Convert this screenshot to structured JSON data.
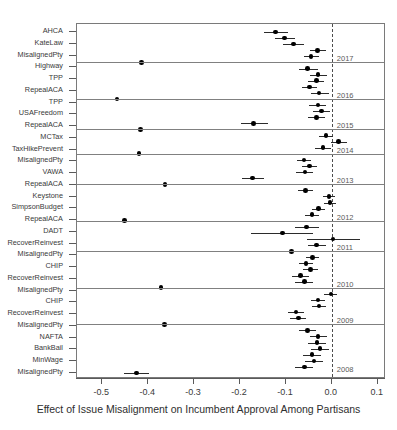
{
  "chart_data": {
    "type": "scatter",
    "title": "",
    "xlabel": "Effect of Issue Misalignment on Incumbent Approval Among Partisans",
    "ylabel": "",
    "xlim": [
      -0.555,
      0.118
    ],
    "xticks": [
      -0.5,
      -0.4,
      -0.3,
      -0.2,
      -0.1,
      0.0,
      0.1
    ],
    "xticklabels": [
      "-0.5",
      "-0.4",
      "-0.3",
      "-0.2",
      "-0.1",
      "0.0",
      "0.1"
    ],
    "grid": false,
    "legend_position": "none",
    "reference_line": 0.0,
    "reference_line_style": "dashed",
    "year_labels": [
      "2017",
      "2016",
      "2015",
      "2014",
      "2013",
      "2012",
      "2011",
      "2010",
      "2009",
      "2008"
    ],
    "categories": [
      "AHCA",
      "KateLaw",
      "MisalignedPty",
      "Highway",
      "TPP",
      "RepealACA",
      "TPP",
      "USAFreedom",
      "RepealACA",
      "MCTax",
      "TaxHikePrevent",
      "MisalignedPty",
      "VAWA",
      "RepealACA",
      "Keystone",
      "SimpsonBudget",
      "RepealACA",
      "DADT",
      "RecoverReinvest",
      "MisalignedPty",
      "CHIP",
      "RecoverReinvest",
      "MisalignedPty",
      "CHIP",
      "RecoverReinvest",
      "MisalignedPty",
      "NAFTA",
      "BankBail",
      "MinWage",
      "MisalignedPty"
    ],
    "points": [
      {
        "label": "AHCA",
        "estimate": -0.123,
        "low": -0.147,
        "high": -0.095,
        "year": "2017"
      },
      {
        "label": "KateLaw",
        "estimate": -0.103,
        "low": -0.124,
        "high": -0.08,
        "year": "2017"
      },
      {
        "label": "MisalignedPty",
        "estimate": -0.084,
        "low": -0.107,
        "high": -0.06,
        "year": "2017"
      },
      {
        "label": "Highway",
        "estimate": -0.031,
        "low": -0.048,
        "high": -0.012,
        "year": "2017"
      },
      {
        "label": "TPP",
        "estimate": -0.045,
        "low": -0.06,
        "high": -0.028,
        "year": "2017"
      },
      {
        "label": "RepealACA",
        "estimate": -0.415,
        "low": -0.438,
        "high": -0.39,
        "year": "2017"
      },
      {
        "label": "TPP",
        "estimate": -0.053,
        "low": -0.072,
        "high": -0.03,
        "year": "2016"
      },
      {
        "label": "USAFreedom",
        "estimate": -0.03,
        "low": -0.048,
        "high": -0.01,
        "year": "2016"
      },
      {
        "label": "RepealACA",
        "estimate": -0.034,
        "low": -0.052,
        "high": -0.016,
        "year": "2016"
      },
      {
        "label": "MCTax",
        "estimate": -0.049,
        "low": -0.065,
        "high": -0.032,
        "year": "2016"
      },
      {
        "label": "TaxHikePrevent",
        "estimate": -0.028,
        "low": -0.046,
        "high": -0.007,
        "year": "2016"
      },
      {
        "label": "MisalignedPty",
        "estimate": -0.468,
        "low": -0.5,
        "high": -0.434,
        "year": "2016"
      },
      {
        "label": "VAWA",
        "estimate": -0.03,
        "low": -0.05,
        "high": -0.012,
        "year": "2015"
      },
      {
        "label": "RepealACA",
        "estimate": -0.022,
        "low": -0.04,
        "high": -0.003,
        "year": "2015"
      },
      {
        "label": "Keystone",
        "estimate": -0.034,
        "low": -0.052,
        "high": -0.014,
        "year": "2015"
      },
      {
        "label": "SimpsonBudget",
        "estimate": -0.17,
        "low": -0.198,
        "high": -0.14,
        "year": "2015"
      },
      {
        "label": "RepealACA",
        "estimate": -0.417,
        "low": -0.442,
        "high": -0.39,
        "year": "2015"
      },
      {
        "label": "DADT",
        "estimate": -0.013,
        "low": -0.028,
        "high": 0.002,
        "year": "2014"
      },
      {
        "label": "RecoverReinvest",
        "estimate": 0.015,
        "low": -0.002,
        "high": 0.032,
        "year": "2014"
      },
      {
        "label": "MisalignedPty",
        "estimate": -0.019,
        "low": -0.036,
        "high": -0.002,
        "year": "2014"
      },
      {
        "label": "CHIP",
        "estimate": -0.42,
        "low": -0.445,
        "high": -0.392,
        "year": "2014"
      },
      {
        "label": "RecoverReinvest",
        "estimate": -0.061,
        "low": -0.076,
        "high": -0.045,
        "year": "2013"
      },
      {
        "label": "MisalignedPty",
        "estimate": -0.049,
        "low": -0.065,
        "high": -0.032,
        "year": "2013"
      },
      {
        "label": "CHIP",
        "estimate": -0.058,
        "low": -0.077,
        "high": -0.04,
        "year": "2013"
      },
      {
        "label": "RecoverReinvest",
        "estimate": -0.173,
        "low": -0.195,
        "high": -0.148,
        "year": "2013"
      },
      {
        "label": "MisalignedPty",
        "estimate": -0.363,
        "low": -0.382,
        "high": -0.343,
        "year": "2013"
      },
      {
        "label": "NAFTA",
        "estimate": -0.057,
        "low": -0.074,
        "high": -0.04,
        "year": "2012"
      },
      {
        "label": "BankBail",
        "estimate": -0.006,
        "low": -0.02,
        "high": 0.008,
        "year": "2012"
      },
      {
        "label": "MinWage",
        "estimate": -0.004,
        "low": -0.018,
        "high": 0.01,
        "year": "2012"
      },
      {
        "label": "MisalignedPty",
        "estimate": -0.029,
        "low": -0.043,
        "high": -0.014,
        "year": "2012"
      },
      {
        "label": "pt31",
        "estimate": -0.043,
        "low": -0.058,
        "high": -0.029,
        "year": "2012"
      },
      {
        "label": "pt32",
        "estimate": -0.452,
        "low": -0.47,
        "high": -0.432,
        "year": "2012"
      },
      {
        "label": "pt33",
        "estimate": -0.055,
        "low": -0.08,
        "high": -0.028,
        "year": "2011"
      },
      {
        "label": "pt34",
        "estimate": -0.108,
        "low": -0.175,
        "high": -0.04,
        "year": "2011"
      },
      {
        "label": "pt35",
        "estimate": 0.003,
        "low": -0.055,
        "high": 0.062,
        "year": "2011"
      },
      {
        "label": "pt36",
        "estimate": -0.034,
        "low": -0.052,
        "high": -0.012,
        "year": "2011"
      },
      {
        "label": "pt37",
        "estimate": -0.088,
        "low": -0.13,
        "high": -0.048,
        "year": "2011"
      },
      {
        "label": "pt38",
        "estimate": -0.042,
        "low": -0.056,
        "high": -0.028,
        "year": "2010"
      },
      {
        "label": "pt39",
        "estimate": -0.056,
        "low": -0.072,
        "high": -0.04,
        "year": "2010"
      },
      {
        "label": "pt40",
        "estimate": -0.046,
        "low": -0.062,
        "high": -0.03,
        "year": "2010"
      },
      {
        "label": "pt41",
        "estimate": -0.068,
        "low": -0.086,
        "high": -0.05,
        "year": "2010"
      },
      {
        "label": "pt42",
        "estimate": -0.06,
        "low": -0.08,
        "high": -0.042,
        "year": "2010"
      },
      {
        "label": "pt43",
        "estimate": -0.372,
        "low": -0.39,
        "high": -0.352,
        "year": "2010"
      },
      {
        "label": "pt44",
        "estimate": -0.002,
        "low": -0.016,
        "high": 0.012,
        "year": "2009"
      },
      {
        "label": "pt45",
        "estimate": -0.03,
        "low": -0.046,
        "high": -0.014,
        "year": "2009"
      },
      {
        "label": "pt46",
        "estimate": -0.028,
        "low": -0.044,
        "high": -0.012,
        "year": "2009"
      },
      {
        "label": "pt47",
        "estimate": -0.078,
        "low": -0.096,
        "high": -0.06,
        "year": "2009"
      },
      {
        "label": "pt48",
        "estimate": -0.073,
        "low": -0.09,
        "high": -0.056,
        "year": "2009"
      },
      {
        "label": "pt49",
        "estimate": -0.365,
        "low": -0.382,
        "high": -0.347,
        "year": "2009"
      },
      {
        "label": "pt50",
        "estimate": -0.053,
        "low": -0.072,
        "high": -0.034,
        "year": "2008"
      },
      {
        "label": "pt51",
        "estimate": -0.03,
        "low": -0.048,
        "high": -0.01,
        "year": "2008"
      },
      {
        "label": "pt52",
        "estimate": -0.032,
        "low": -0.052,
        "high": -0.012,
        "year": "2008"
      },
      {
        "label": "pt53",
        "estimate": -0.026,
        "low": -0.046,
        "high": -0.006,
        "year": "2008"
      },
      {
        "label": "pt54",
        "estimate": -0.043,
        "low": -0.062,
        "high": -0.024,
        "year": "2008"
      },
      {
        "label": "pt55",
        "estimate": -0.039,
        "low": -0.058,
        "high": -0.02,
        "year": "2008"
      },
      {
        "label": "pt56",
        "estimate": -0.06,
        "low": -0.08,
        "high": -0.04,
        "year": "2008"
      },
      {
        "label": "pt57",
        "estimate": -0.425,
        "low": -0.452,
        "high": -0.398,
        "year": "2008"
      }
    ]
  },
  "axis": {
    "x_label": "Effect of Issue Misalignment on Incumbent Approval Among Partisans"
  }
}
